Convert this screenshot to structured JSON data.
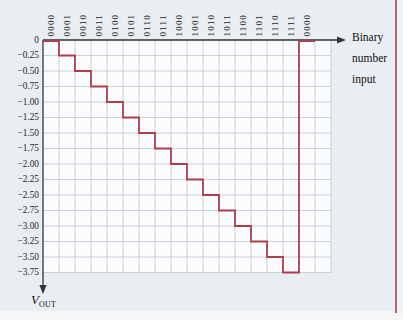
{
  "figure": {
    "x_axis_title_lines": [
      "Binary",
      "number",
      "input"
    ],
    "y_axis_title": {
      "base": "V",
      "subscript": "OUT"
    }
  },
  "chart_data": {
    "type": "line",
    "subtype": "staircase-dac-output",
    "title": "",
    "xlabel": "Binary number input",
    "ylabel": "VOUT",
    "x_labels": [
      "0000",
      "0001",
      "0010",
      "0011",
      "0100",
      "0101",
      "0110",
      "0111",
      "1000",
      "1001",
      "1010",
      "1011",
      "1100",
      "1101",
      "1110",
      "1111",
      "0000"
    ],
    "values": [
      0,
      -0.25,
      -0.5,
      -0.75,
      -1.0,
      -1.25,
      -1.5,
      -1.75,
      -2.0,
      -2.25,
      -2.5,
      -2.75,
      -3.0,
      -3.25,
      -3.5,
      -3.75,
      0
    ],
    "y_tick_labels": [
      "0",
      "−0.25",
      "−0.50",
      "−0.75",
      "−1.00",
      "−1.25",
      "−1.50",
      "−1.75",
      "−2.00",
      "−2.25",
      "−2.50",
      "−2.75",
      "−3.00",
      "−3.25",
      "−3.50",
      "−3.75"
    ],
    "y_tick_values": [
      0,
      -0.25,
      -0.5,
      -0.75,
      -1.0,
      -1.25,
      -1.5,
      -1.75,
      -2.0,
      -2.25,
      -2.5,
      -2.75,
      -3.0,
      -3.25,
      -3.5,
      -3.75
    ],
    "ylim": [
      -3.75,
      0
    ],
    "step_volts": -0.25,
    "grid": true,
    "legend": "none",
    "colors": {
      "trace": "#b03d4b",
      "grid_line": "#c7cbcf",
      "axis": "#333333",
      "text": "#1e1e1e",
      "panel_bg": "#e9eef3",
      "plot_bg": "#fbfcfd",
      "margin_rule": "#b56270"
    }
  }
}
